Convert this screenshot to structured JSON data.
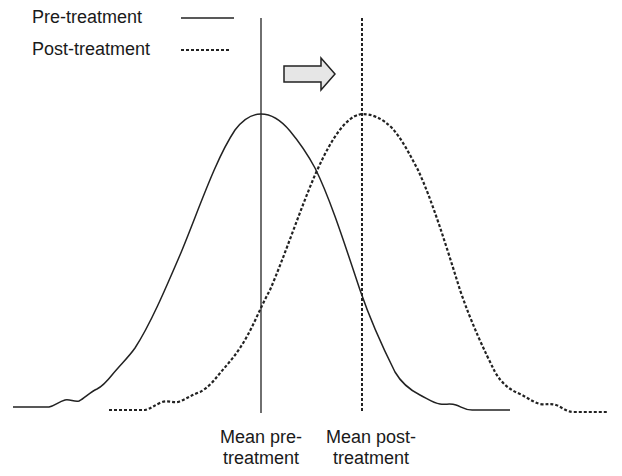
{
  "legend": {
    "items": [
      {
        "label": "Pre-treatment",
        "line_style": "solid"
      },
      {
        "label": "Post-treatment",
        "line_style": "dashed"
      }
    ]
  },
  "shift_arrow": {
    "direction": "right",
    "fill": "#e6e6e6",
    "stroke": "#222222"
  },
  "markers": {
    "pre_mean": {
      "line1": "Mean pre-",
      "line2": "treatment",
      "line_style": "solid"
    },
    "post_mean": {
      "line1": "Mean post-",
      "line2": "treatment",
      "line_style": "dashed"
    }
  },
  "colors": {
    "line": "#222222",
    "background": "#ffffff"
  }
}
